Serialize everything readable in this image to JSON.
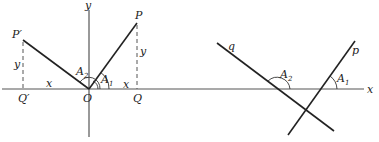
{
  "figure_left": {
    "axes": {
      "x_label": "x",
      "y_label": "y"
    },
    "points": {
      "origin": "O",
      "P": "P",
      "Q": "Q",
      "P_prime": "P′",
      "Q_prime": "Q′"
    },
    "segment_labels": {
      "x_right": "x",
      "y_right": "y",
      "x_left": "x",
      "y_left": "y"
    },
    "angles": {
      "A1": {
        "base": "A",
        "sub": "1"
      },
      "A2": {
        "base": "A",
        "sub": "2"
      }
    }
  },
  "figure_right": {
    "axes": {
      "x_label": "x"
    },
    "lines": {
      "p": "p",
      "q": "q"
    },
    "angles": {
      "A1": {
        "base": "A",
        "sub": "1"
      },
      "A2": {
        "base": "A",
        "sub": "2"
      }
    }
  },
  "colors": {
    "line": "#222222",
    "axis": "#555555",
    "background": "#ffffff"
  }
}
